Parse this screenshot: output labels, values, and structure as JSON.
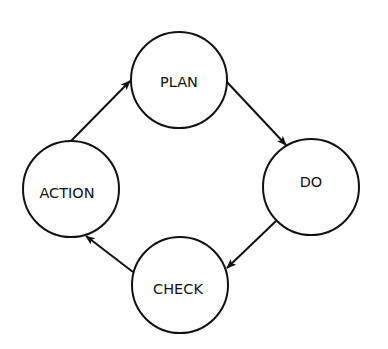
{
  "diagram": {
    "type": "cycle",
    "stroke_color": "#111111",
    "background": "#ffffff",
    "nodes": [
      {
        "id": "plan",
        "label": "PLAN",
        "cx": 179,
        "cy": 80,
        "r": 48
      },
      {
        "id": "do",
        "label": "DO",
        "cx": 311,
        "cy": 187,
        "r": 48
      },
      {
        "id": "check",
        "label": "CHECK",
        "cx": 180,
        "cy": 285,
        "r": 48
      },
      {
        "id": "action",
        "label": "ACTION",
        "cx": 71,
        "cy": 189,
        "r": 48
      }
    ],
    "edges": [
      {
        "from": "PLAN",
        "to": "DO",
        "x1": 226,
        "y1": 81,
        "x2": 286,
        "y2": 145
      },
      {
        "from": "DO",
        "to": "CHECK",
        "x1": 276,
        "y1": 221,
        "x2": 227,
        "y2": 268
      },
      {
        "from": "CHECK",
        "to": "ACTION",
        "x1": 133,
        "y1": 272,
        "x2": 86,
        "y2": 236
      },
      {
        "from": "ACTION",
        "to": "PLAN",
        "x1": 71,
        "y1": 141,
        "x2": 130,
        "y2": 81
      }
    ]
  }
}
